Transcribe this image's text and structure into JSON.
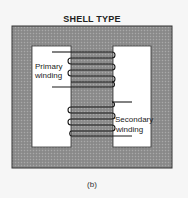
{
  "diagram": {
    "title": "SHELL TYPE",
    "caption": "(b)",
    "labels": {
      "primary_line1": "Primary",
      "primary_line2": "winding",
      "secondary_line1": "Secondary",
      "secondary_line2": "winding"
    },
    "colors": {
      "core_fill": "#8f8f8f",
      "core_outline": "#333333",
      "window_fill": "#ffffff",
      "wire": "#1a1a1a",
      "background": "#f6f6f6"
    },
    "core": {
      "outer": {
        "x": 12,
        "y": 26,
        "w": 160,
        "h": 142
      },
      "left_window": {
        "x": 32,
        "y": 46,
        "w": 39,
        "h": 101
      },
      "right_window": {
        "x": 113,
        "y": 46,
        "w": 38,
        "h": 101
      }
    },
    "primary_turns": 3,
    "secondary_turns": 3
  }
}
